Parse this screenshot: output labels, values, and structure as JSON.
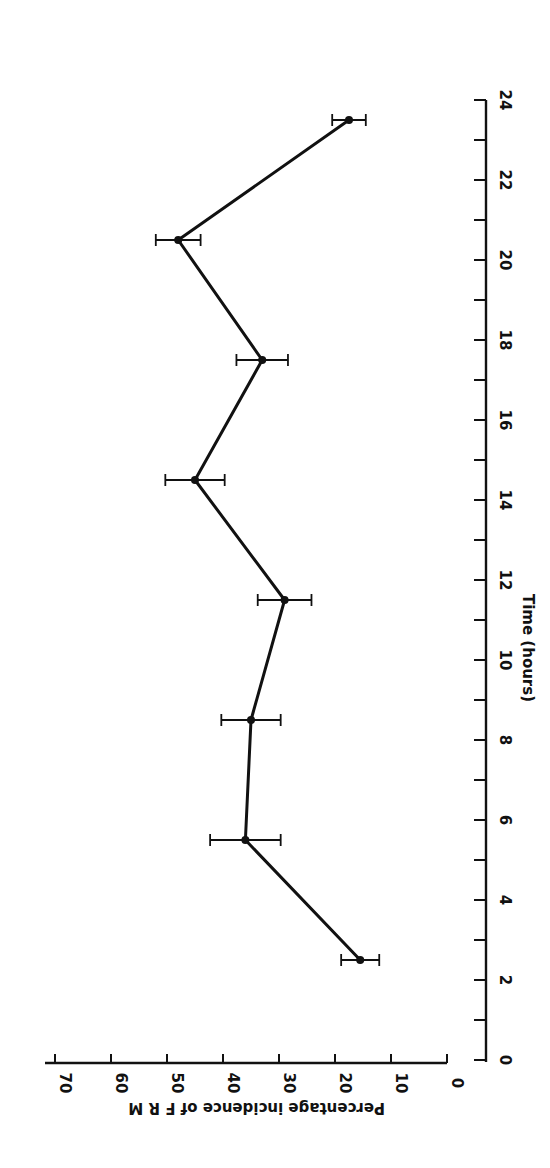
{
  "chart_data": {
    "type": "line",
    "orientation": "rotated 90 degrees clockwise",
    "title": "",
    "xlabel": "Time (hours)",
    "ylabel": "Percentage incidence of F R M",
    "xlim": [
      0,
      24
    ],
    "ylim": [
      0,
      70
    ],
    "x_ticks": [
      0,
      2,
      4,
      6,
      8,
      10,
      12,
      14,
      16,
      18,
      20,
      22,
      24
    ],
    "x_minor_ticks": [
      1,
      3,
      5,
      7,
      9,
      11,
      13,
      15,
      17,
      19,
      21,
      23
    ],
    "y_ticks": [
      0,
      10,
      20,
      30,
      40,
      50,
      60,
      70
    ],
    "grid": false,
    "legend": null,
    "series": [
      {
        "name": "Percentage incidence of FRM",
        "x": [
          2.5,
          5.5,
          8.5,
          11.5,
          14.5,
          17.5,
          20.5,
          23.5
        ],
        "values": [
          15.5,
          36,
          35,
          29,
          45,
          33,
          48,
          17.5
        ],
        "error": [
          3.4,
          6.3,
          5.3,
          4.8,
          5.3,
          4.6,
          4,
          3
        ]
      }
    ]
  },
  "axes": {
    "x_title": "Time (hours)",
    "y_title": "Percentage incidence of F R M",
    "x_tick_labels": [
      "0",
      "2",
      "4",
      "6",
      "8",
      "10",
      "12",
      "14",
      "16",
      "18",
      "20",
      "22",
      "24"
    ],
    "y_tick_labels": [
      "0",
      "10",
      "20",
      "30",
      "40",
      "50",
      "60",
      "70"
    ]
  },
  "colors": {
    "ink": "#111111",
    "background": "#ffffff"
  }
}
